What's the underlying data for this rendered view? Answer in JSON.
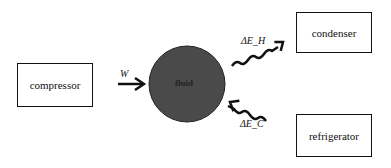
{
  "diagram": {
    "nodes": {
      "compressor": "compressor",
      "fluid": "fluid",
      "condenser": "condenser",
      "refrigerator": "refrigerator"
    },
    "edges": {
      "work": {
        "label": "W",
        "from": "compressor",
        "to": "fluid"
      },
      "heat_out": {
        "label": "ΔE_H",
        "from": "fluid",
        "to": "condenser"
      },
      "heat_in": {
        "label": "ΔE_C",
        "from": "refrigerator",
        "to": "fluid"
      }
    },
    "colors": {
      "fluid_fill": "#4a4a4a",
      "stroke": "#111111"
    }
  }
}
